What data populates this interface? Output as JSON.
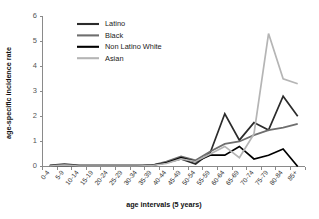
{
  "chart_data": {
    "type": "line",
    "title": "",
    "xlabel": "age intervals (5 years)",
    "ylabel": "age-specific incidence rate",
    "ylim": [
      0,
      6
    ],
    "yticks": [
      0,
      1,
      2,
      3,
      4,
      5,
      6
    ],
    "grid": false,
    "legend_position": "top-left-inside",
    "categories": [
      "0-4",
      "5-9",
      "10-14",
      "15-19",
      "20-24",
      "25-29",
      "30-34",
      "35-39",
      "40-44",
      "45-49",
      "50-54",
      "55-59",
      "60-64",
      "65-69",
      "70-74",
      "75-79",
      "80-84",
      "85+"
    ],
    "series": [
      {
        "name": "Latino",
        "color": "#2b2b2b",
        "values": [
          0.05,
          0.1,
          0.05,
          0.05,
          0.05,
          0.05,
          0.05,
          0.05,
          0.15,
          0.3,
          0.1,
          0.55,
          2.1,
          1.05,
          1.75,
          1.45,
          2.8,
          2.0
        ]
      },
      {
        "name": "Black",
        "color": "#6e6e6e",
        "values": [
          0.03,
          0.07,
          0.03,
          0.03,
          0.03,
          0.03,
          0.03,
          0.05,
          0.2,
          0.4,
          0.25,
          0.6,
          0.9,
          1.0,
          1.25,
          1.45,
          1.55,
          1.7
        ]
      },
      {
        "name": "Non Latino White",
        "color": "#000000",
        "values": [
          0.02,
          0.05,
          0.02,
          0.02,
          0.02,
          0.02,
          0.02,
          0.05,
          0.15,
          0.35,
          0.2,
          0.45,
          0.45,
          0.8,
          0.3,
          0.45,
          0.7,
          0.0
        ]
      },
      {
        "name": "Asian",
        "color": "#b5b5b5",
        "values": [
          0.02,
          0.06,
          0.02,
          0.02,
          0.02,
          0.02,
          0.02,
          0.04,
          0.12,
          0.3,
          0.2,
          0.5,
          0.8,
          0.35,
          1.3,
          5.3,
          3.5,
          3.3
        ]
      }
    ]
  },
  "axes": {
    "x_title": "age intervals (5 years)",
    "y_title": "age-specific incidence rate",
    "y_tick_labels": [
      "0",
      "1",
      "2",
      "3",
      "4",
      "5",
      "6"
    ],
    "x_tick_labels": [
      "0-4",
      "5-9",
      "10-14",
      "15-19",
      "20-24",
      "25-29",
      "30-34",
      "35-39",
      "40-44",
      "45-49",
      "50-54",
      "55-59",
      "60-64",
      "65-69",
      "70-74",
      "75-79",
      "80-84",
      "85+"
    ]
  },
  "legend": {
    "entries": [
      {
        "label": "Latino",
        "color": "#2b2b2b"
      },
      {
        "label": "Black",
        "color": "#6e6e6e"
      },
      {
        "label": "Non Latino White",
        "color": "#000000"
      },
      {
        "label": "Asian",
        "color": "#b5b5b5"
      }
    ]
  }
}
